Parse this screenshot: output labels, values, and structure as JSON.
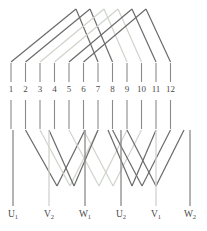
{
  "figure": {
    "type": "diagram",
    "width": 207,
    "height": 231,
    "background": "#ffffff"
  },
  "colors": {
    "dark_line": "#6b6b6b",
    "mid_line": "#9a9a9a",
    "light_line": "#cfd4cb",
    "tick": "#8a8a8a",
    "text": "#4a4a4a"
  },
  "terminals": {
    "count": 12,
    "labels": [
      "1",
      "2",
      "3",
      "4",
      "5",
      "6",
      "7",
      "8",
      "9",
      "10",
      "11",
      "12"
    ],
    "x": [
      11,
      25.5,
      40,
      54.5,
      69,
      83.5,
      98,
      112.5,
      127,
      141.5,
      156,
      170.5
    ],
    "upper_tick": {
      "y_top": 63,
      "y_bottom": 82
    },
    "lower_tick": {
      "y_top": 100,
      "y_bottom": 129
    },
    "label_y": 84
  },
  "outputs": {
    "count": 6,
    "labels": [
      "U",
      "V",
      "W",
      "U",
      "V",
      "W"
    ],
    "subscripts": [
      "1",
      "2",
      "1",
      "2",
      "1",
      "2"
    ],
    "display": [
      "U1",
      "V2",
      "W1",
      "U2",
      "V1",
      "W2"
    ],
    "x": [
      13,
      49,
      85,
      121,
      156,
      190
    ],
    "stem_top": 130,
    "stem_bottom": 206,
    "label_y": 209
  },
  "top_connections": {
    "description": "chevron arcs joining upper terminals through an apex",
    "apex_y": 9,
    "base_y": 62,
    "arcs": [
      {
        "left": 11,
        "right": 98,
        "apex_x": 76,
        "color": "dark"
      },
      {
        "left": 25.5,
        "right": 112.5,
        "apex_x": 90,
        "color": "dark"
      },
      {
        "left": 40,
        "right": 127,
        "apex_x": 104,
        "color": "light"
      },
      {
        "left": 54.5,
        "right": 141.5,
        "apex_x": 118,
        "color": "light"
      },
      {
        "left": 69,
        "right": 156,
        "apex_x": 132,
        "color": "dark"
      },
      {
        "left": 83.5,
        "right": 170.5,
        "apex_x": 146,
        "color": "dark"
      }
    ]
  },
  "bottom_connections": {
    "description": "V shaped routes from lower terminals down to outputs",
    "top_y": 130,
    "valley_y": 186,
    "routes": [
      {
        "from": 25.5,
        "to": 85,
        "valley_x": 57,
        "color": "dark"
      },
      {
        "from": 40,
        "to": 98,
        "valley_x": 70,
        "color": "light"
      },
      {
        "from": 69,
        "to": 127,
        "valley_x": 99,
        "color": "light"
      },
      {
        "from": 83.5,
        "to": 141.5,
        "valley_x": 113,
        "color": "light"
      },
      {
        "from": 112.5,
        "to": 170.5,
        "valley_x": 142,
        "color": "dark"
      },
      {
        "from": 127,
        "to": 184,
        "valley_x": 156,
        "color": "dark"
      },
      {
        "from": 98,
        "to": 49,
        "valley_x": 74,
        "color": "dark"
      },
      {
        "from": 156,
        "to": 108,
        "valley_x": 132,
        "color": "dark"
      }
    ]
  }
}
